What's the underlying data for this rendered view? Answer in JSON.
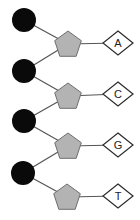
{
  "diagram": {
    "colors": {
      "phosphate": "#0a0a0a",
      "sugar_fill": "#b3b3b3",
      "sugar_stroke": "#6e6e6e",
      "base_fill": "#ffffff",
      "base_stroke": "#2a2a2a",
      "line": "#555555"
    },
    "nucleotides": [
      {
        "phosphate": {
          "cx": 24,
          "cy": 20
        },
        "sugar": {
          "cx": 68,
          "cy": 44
        },
        "base": {
          "cx": 118,
          "cy": 43,
          "label": "A"
        }
      },
      {
        "phosphate": {
          "cx": 24,
          "cy": 71
        },
        "sugar": {
          "cx": 68,
          "cy": 96
        },
        "base": {
          "cx": 118,
          "cy": 94,
          "label": "C"
        }
      },
      {
        "phosphate": {
          "cx": 24,
          "cy": 121
        },
        "sugar": {
          "cx": 68,
          "cy": 146
        },
        "base": {
          "cx": 118,
          "cy": 145,
          "label": "G"
        }
      },
      {
        "phosphate": {
          "cx": 23,
          "cy": 173
        },
        "sugar": {
          "cx": 67,
          "cy": 197
        },
        "base": {
          "cx": 118,
          "cy": 196,
          "label": "T"
        }
      }
    ]
  }
}
